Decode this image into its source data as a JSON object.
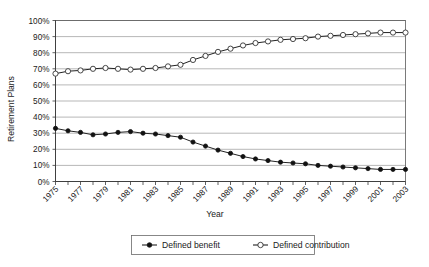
{
  "chart_data": {
    "type": "line",
    "title": "",
    "xlabel": "Year",
    "ylabel": "Retirement Plans",
    "ylim": [
      0,
      100
    ],
    "xlim": [
      1975,
      2003
    ],
    "grid": true,
    "legend_position": "bottom",
    "y_ticks": [
      "0%",
      "10%",
      "20%",
      "30%",
      "40%",
      "50%",
      "60%",
      "70%",
      "80%",
      "90%",
      "100%"
    ],
    "y_tick_values": [
      0,
      10,
      20,
      30,
      40,
      50,
      60,
      70,
      80,
      90,
      100
    ],
    "x": [
      1975,
      1976,
      1977,
      1978,
      1979,
      1980,
      1981,
      1982,
      1983,
      1984,
      1985,
      1986,
      1987,
      1988,
      1989,
      1990,
      1991,
      1992,
      1993,
      1994,
      1995,
      1996,
      1997,
      1998,
      1999,
      2000,
      2001,
      2002,
      2003
    ],
    "x_tick_labels": [
      "1975",
      "1977",
      "1979",
      "1981",
      "1983",
      "1985",
      "1987",
      "1989",
      "1991",
      "1993",
      "1995",
      "1997",
      "1999",
      "2001",
      "2003"
    ],
    "x_tick_values": [
      1975,
      1977,
      1979,
      1981,
      1983,
      1985,
      1987,
      1989,
      1991,
      1993,
      1995,
      1997,
      1999,
      2001,
      2003
    ],
    "series": [
      {
        "name": "Defined benefit",
        "marker": "filled-circle",
        "values": [
          33,
          31.5,
          30.5,
          29,
          29.5,
          30.5,
          31,
          30,
          29.5,
          28.5,
          27.5,
          24.5,
          22,
          19.5,
          17.5,
          15.5,
          14,
          13,
          12,
          11.5,
          11,
          10,
          9.5,
          9,
          8.5,
          8,
          7.5,
          7.5,
          7.5
        ]
      },
      {
        "name": "Defined contribution",
        "marker": "open-circle",
        "values": [
          67,
          68.5,
          69,
          70,
          70.5,
          70,
          69.5,
          70,
          70.5,
          71.5,
          72.5,
          75.5,
          78,
          80.5,
          82.5,
          84.5,
          86,
          87,
          88,
          88.5,
          89,
          90,
          90.5,
          91,
          91.5,
          92,
          92.5,
          92.5,
          92.5
        ]
      }
    ]
  },
  "legend": {
    "entries": [
      {
        "label": "Defined benefit",
        "marker": "filled-circle"
      },
      {
        "label": "Defined contribution",
        "marker": "open-circle"
      }
    ]
  },
  "colors": {
    "series_line": "#222222",
    "grid": "#9a9a9a",
    "axis": "#3a3a3a",
    "background": "#ffffff"
  }
}
